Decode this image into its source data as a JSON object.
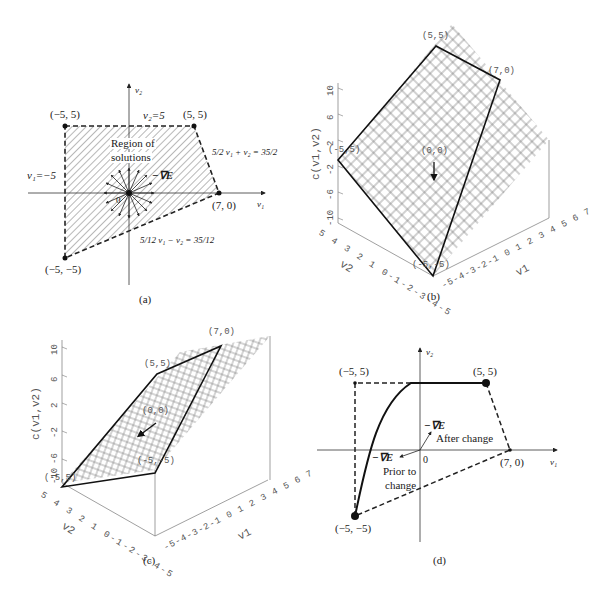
{
  "figure": {
    "panels": [
      {
        "id": "a",
        "caption": "(a)"
      },
      {
        "id": "b",
        "caption": "(b)"
      },
      {
        "id": "c",
        "caption": "(c)"
      },
      {
        "id": "d",
        "caption": "(d)"
      }
    ]
  },
  "panel_a": {
    "caption": "(a)",
    "axis_x_label": "v₁",
    "axis_y_label": "v₂",
    "origin_label": "0",
    "vertices": [
      {
        "label": "(−5, 5)",
        "v1": -5,
        "v2": 5
      },
      {
        "label": "(5, 5)",
        "v1": 5,
        "v2": 5
      },
      {
        "label": "(7, 0)",
        "v1": 7,
        "v2": 0
      },
      {
        "label": "(−5, −5)",
        "v1": -5,
        "v2": -5
      }
    ],
    "constraints": {
      "top": "v₂=5",
      "left": "v₁=−5",
      "right": "5/2 v₁ + v₂ = 35/2",
      "bottom": "5/12 v₁ − v₂ = 35/12"
    },
    "region_label_line1": "Region of",
    "region_label_line2": "solutions",
    "gradient_label": "−∇E"
  },
  "panel_b": {
    "caption": "(b)",
    "z_axis_label": "c(v1,v2)",
    "z_ticks": [
      "10",
      "6",
      "2",
      "-2",
      "-6",
      "-10"
    ],
    "v2_axis_label": "v2",
    "v2_ticks": [
      "5",
      "4",
      "3",
      "2",
      "1",
      "0",
      "-1",
      "-2",
      "-3",
      "-4",
      "-5"
    ],
    "v1_axis_label": "v1",
    "v1_ticks": [
      "-5",
      "-4",
      "-3",
      "-2",
      "-1",
      "0",
      "1",
      "2",
      "3",
      "4",
      "5",
      "6",
      "7"
    ],
    "point_labels": {
      "p55": "(5,5)",
      "p70": "(7,0)",
      "pm55": "(-5,5)",
      "p00": "(0,0)",
      "pm5m5": "(-5,-5)"
    }
  },
  "panel_c": {
    "caption": "(c)",
    "z_axis_label": "c(v1,v2)",
    "z_ticks": [
      "10",
      "6",
      "2",
      "-2",
      "-6",
      "-10"
    ],
    "v2_axis_label": "v2",
    "v2_ticks": [
      "5",
      "4",
      "3",
      "2",
      "1",
      "0",
      "-1",
      "-2",
      "-3",
      "-4",
      "-5"
    ],
    "v1_axis_label": "v1",
    "v1_ticks": [
      "-5",
      "-4",
      "-3",
      "-2",
      "-1",
      "0",
      "1",
      "2",
      "3",
      "4",
      "5",
      "6",
      "7"
    ],
    "point_labels": {
      "p70": "(7,0)",
      "p55": "(5,5)",
      "p00": "(0,0)",
      "pm5m5": "(-5,-5)",
      "pm55": "(-5,5)"
    }
  },
  "panel_d": {
    "caption": "(d)",
    "axis_x_label": "v₁",
    "axis_y_label": "v₂",
    "origin_label": "0",
    "vertices": [
      {
        "label": "(−5, 5)",
        "v1": -5,
        "v2": 5
      },
      {
        "label": "(5, 5)",
        "v1": 5,
        "v2": 5
      },
      {
        "label": "(7, 0)",
        "v1": 7,
        "v2": 0
      },
      {
        "label": "(−5, −5)",
        "v1": -5,
        "v2": -5
      }
    ],
    "after_label_1": "−∇E",
    "after_label_2": "After change",
    "prior_label_1": "−∇E",
    "prior_label_2": "Prior to",
    "prior_label_3": "change"
  }
}
